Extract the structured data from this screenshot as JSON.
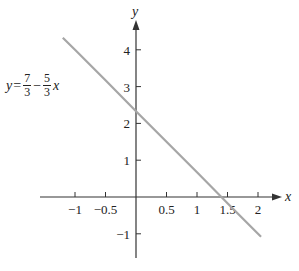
{
  "chart_data": {
    "type": "line",
    "title": "",
    "xlabel": "x",
    "ylabel": "y",
    "xlim": [
      -1.3,
      2.45
    ],
    "ylim": [
      -1.7,
      4.8
    ],
    "grid": false,
    "x_ticks": [
      -1,
      -0.5,
      0.5,
      1,
      1.5,
      2
    ],
    "x_tick_labels": [
      "−1",
      "−0.5",
      "0.5",
      "1",
      "1.5",
      "2"
    ],
    "y_ticks": [
      4,
      3,
      2,
      1,
      -1
    ],
    "y_tick_labels": [
      "4",
      "3",
      "2",
      "1",
      "−1"
    ],
    "series": [
      {
        "name": "y = 7/3 − (5/3)x",
        "equation": "y = 7/3 - 5/3 x",
        "x": [
          -1.2,
          -1,
          -0.5,
          0,
          0.5,
          1,
          1.4,
          1.5,
          2,
          2.05
        ],
        "y": [
          4.33,
          4.0,
          3.17,
          2.33,
          1.5,
          0.67,
          0.0,
          -0.17,
          -1.0,
          -1.08
        ],
        "color": "#a6a6a6"
      }
    ],
    "annotations": [
      {
        "text": "y = 7/3 − 5/3 x",
        "position": "left of line, near y=3"
      }
    ]
  },
  "equation_label": {
    "lhs": "y",
    "eq": "=",
    "frac1_num": "7",
    "frac1_den": "3",
    "minus": "−",
    "frac2_num": "5",
    "frac2_den": "3",
    "var": "x"
  },
  "colors": {
    "axis": "#333333",
    "line": "#a6a6a6",
    "text": "#222222"
  }
}
